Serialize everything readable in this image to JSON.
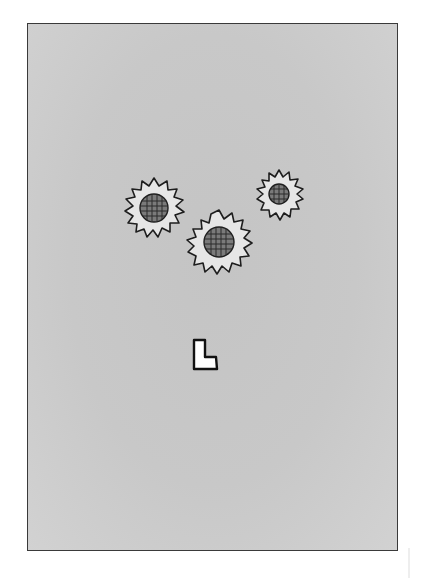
{
  "card": {
    "name": "flower-card",
    "background_color": "#c8c8c8",
    "border_color": "#3a3a3a",
    "symbol": {
      "type": "letter-outline",
      "label": "L",
      "fill": "#ffffff",
      "stroke": "#111111"
    },
    "flowers": [
      {
        "name": "sunflower-left",
        "cx": 153,
        "cy": 207,
        "r_outer": 30,
        "r_center": 14
      },
      {
        "name": "sunflower-middle",
        "cx": 218,
        "cy": 241,
        "r_outer": 32,
        "r_center": 15
      },
      {
        "name": "sunflower-right",
        "cx": 278,
        "cy": 193,
        "r_outer": 24,
        "r_center": 10
      }
    ],
    "colors": {
      "petal_fill": "#e6e6e6",
      "outline": "#1e1e1e",
      "center_fill": "#7a7a7a",
      "center_grid": "#2a2a2a"
    }
  }
}
